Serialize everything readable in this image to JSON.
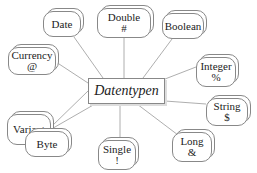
{
  "diagram": {
    "center": {
      "label": "Datentypen",
      "x": 88,
      "y": 78,
      "w": 77,
      "h": 26
    },
    "nodes": [
      {
        "id": "date",
        "label": "Date",
        "symbol": "",
        "x": 43,
        "y": 11,
        "w": 38,
        "h": 26
      },
      {
        "id": "double",
        "label": "Double",
        "symbol": "#",
        "x": 97,
        "y": 8,
        "w": 54,
        "h": 30
      },
      {
        "id": "boolean",
        "label": "Boolean",
        "symbol": "",
        "x": 162,
        "y": 13,
        "w": 42,
        "h": 26
      },
      {
        "id": "currency",
        "label": "Currency",
        "symbol": "@",
        "x": 8,
        "y": 47,
        "w": 48,
        "h": 28
      },
      {
        "id": "integer",
        "label": "Integer",
        "symbol": "%",
        "x": 196,
        "y": 57,
        "w": 40,
        "h": 30
      },
      {
        "id": "variant",
        "label": "Variant",
        "symbol": "",
        "x": 7,
        "y": 114,
        "w": 44,
        "h": 31
      },
      {
        "id": "string",
        "label": "String",
        "symbol": "$",
        "x": 206,
        "y": 98,
        "w": 42,
        "h": 28
      },
      {
        "id": "byte",
        "label": "Byte",
        "symbol": "",
        "x": 25,
        "y": 131,
        "w": 44,
        "h": 26
      },
      {
        "id": "single",
        "label": "Single",
        "symbol": "!",
        "x": 98,
        "y": 140,
        "w": 38,
        "h": 30
      },
      {
        "id": "long",
        "label": "Long",
        "symbol": "&",
        "x": 172,
        "y": 132,
        "w": 40,
        "h": 30
      }
    ],
    "edges": [
      {
        "from": "center",
        "to": "date",
        "x1": 103,
        "y1": 78,
        "x2": 74,
        "y2": 37
      },
      {
        "from": "center",
        "to": "double",
        "x1": 124,
        "y1": 78,
        "x2": 124,
        "y2": 38
      },
      {
        "from": "center",
        "to": "boolean",
        "x1": 143,
        "y1": 78,
        "x2": 172,
        "y2": 39
      },
      {
        "from": "center",
        "to": "currency",
        "x1": 88,
        "y1": 83,
        "x2": 56,
        "y2": 62
      },
      {
        "from": "center",
        "to": "integer",
        "x1": 165,
        "y1": 79,
        "x2": 196,
        "y2": 67
      },
      {
        "from": "center",
        "to": "variant",
        "x1": 88,
        "y1": 91,
        "x2": 51,
        "y2": 127
      },
      {
        "from": "center",
        "to": "string",
        "x1": 165,
        "y1": 101,
        "x2": 206,
        "y2": 104
      },
      {
        "from": "center",
        "to": "byte",
        "x1": 95,
        "y1": 104,
        "x2": 48,
        "y2": 131
      },
      {
        "from": "center",
        "to": "single",
        "x1": 120,
        "y1": 104,
        "x2": 120,
        "y2": 140
      },
      {
        "from": "center",
        "to": "long",
        "x1": 137,
        "y1": 104,
        "x2": 178,
        "y2": 135
      }
    ]
  }
}
